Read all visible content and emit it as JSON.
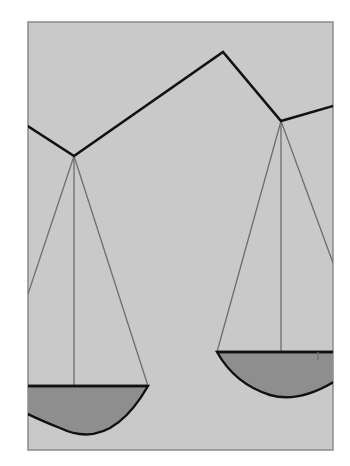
{
  "illustration": {
    "subject": "balance scale",
    "colors": {
      "page_background": "#ffffff",
      "frame_fill": "#c9c9c9",
      "frame_border": "#8a8a8a",
      "beam": "#111111",
      "strings": "#6e6e6e",
      "pan_fill": "#8e8e8e"
    },
    "frame": {
      "x": 28,
      "y": 22,
      "width": 305,
      "height": 428
    },
    "beam_points": [
      [
        28,
        126
      ],
      [
        74,
        156
      ],
      [
        223,
        52
      ],
      [
        281,
        121
      ],
      [
        333,
        106
      ]
    ],
    "left_pan": {
      "pivot": [
        74,
        156
      ],
      "rim_y": 386,
      "rim_x": [
        28,
        148
      ],
      "string_bottom_x": [
        28,
        74,
        148
      ]
    },
    "right_pan": {
      "pivot": [
        281,
        121
      ],
      "rim_y": 352,
      "rim_x": [
        217,
        333
      ],
      "string_bottom_x": [
        217,
        281,
        333
      ]
    }
  }
}
